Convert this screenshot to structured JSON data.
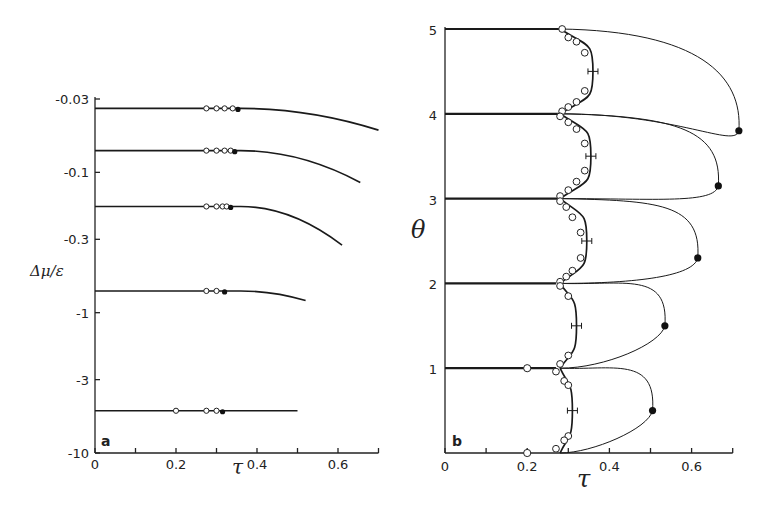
{
  "chart_data": [
    {
      "panel": "a",
      "type": "line",
      "title": "",
      "xlabel": "τ",
      "ylabel": "Δμ/ε",
      "xlim": [
        0,
        0.7
      ],
      "x_ticks": [
        0,
        0.1,
        0.2,
        0.3,
        0.4,
        0.5,
        0.6,
        0.7
      ],
      "x_tick_labels": [
        "0",
        "",
        "0.2",
        "",
        "0.4",
        "",
        "0.6",
        ""
      ],
      "y_scale": "log (negative)",
      "y_ticks": [
        -0.03,
        -0.1,
        -0.3,
        -1,
        -3,
        -10
      ],
      "y_tick_labels": [
        "-0.03",
        "-0.1",
        "-0.3",
        "-1",
        "-3",
        "-10"
      ],
      "grid": false,
      "series": [
        {
          "name": "line-1",
          "y0": -0.035,
          "x_end": 0.7,
          "y_end": -0.05,
          "open_markers": [
            0.275,
            0.3,
            0.32,
            0.34
          ],
          "filled_markers": [
            0.353
          ]
        },
        {
          "name": "line-2",
          "y0": -0.07,
          "x_end": 0.655,
          "y_end": -0.118,
          "open_markers": [
            0.275,
            0.3,
            0.32,
            0.335
          ],
          "filled_markers": [
            0.345
          ]
        },
        {
          "name": "line-3",
          "y0": -0.175,
          "x_end": 0.61,
          "y_end": -0.33,
          "open_markers": [
            0.275,
            0.3,
            0.315,
            0.325
          ],
          "filled_markers": [
            0.335
          ]
        },
        {
          "name": "line-4",
          "y0": -0.7,
          "x_end": 0.52,
          "y_end": -0.82,
          "open_markers": [
            0.275,
            0.3
          ],
          "filled_markers": [
            0.32
          ]
        },
        {
          "name": "line-5",
          "y0": -5.0,
          "x_end": 0.5,
          "y_end": -5.0,
          "open_markers": [
            0.2,
            0.275,
            0.3
          ],
          "filled_markers": [
            0.315
          ]
        }
      ]
    },
    {
      "panel": "b",
      "type": "line",
      "title": "",
      "xlabel": "τ",
      "ylabel": "θ",
      "xlim": [
        0,
        0.7
      ],
      "ylim": [
        0,
        5
      ],
      "x_ticks": [
        0,
        0.1,
        0.2,
        0.3,
        0.4,
        0.5,
        0.6,
        0.7
      ],
      "x_tick_labels": [
        "0",
        "",
        "0.2",
        "",
        "0.4",
        "",
        "0.6",
        ""
      ],
      "y_ticks": [
        1,
        2,
        3,
        4,
        5
      ],
      "y_tick_labels": [
        "1",
        "2",
        "3",
        "4",
        "5"
      ],
      "grid": false,
      "horizontal_lines": [
        {
          "theta": 5,
          "x_end": 0.285
        },
        {
          "theta": 4,
          "x_end": 0.28
        },
        {
          "theta": 3,
          "x_end": 0.275
        },
        {
          "theta": 2,
          "x_end": 0.27
        },
        {
          "theta": 1,
          "x_end": 0.27
        }
      ],
      "inner_loops": [
        {
          "from": 4,
          "to": 5,
          "max_tau": 0.36,
          "open_markers": [
            [
              0.285,
              5.0
            ],
            [
              0.3,
              4.9
            ],
            [
              0.32,
              4.85
            ],
            [
              0.34,
              4.72
            ],
            [
              0.34,
              4.27
            ],
            [
              0.32,
              4.14
            ],
            [
              0.3,
              4.08
            ],
            [
              0.285,
              4.03
            ]
          ],
          "error_bar": [
            0.36,
            4.5
          ]
        },
        {
          "from": 3,
          "to": 4,
          "max_tau": 0.355,
          "open_markers": [
            [
              0.28,
              3.97
            ],
            [
              0.3,
              3.9
            ],
            [
              0.32,
              3.82
            ],
            [
              0.34,
              3.65
            ],
            [
              0.34,
              3.33
            ],
            [
              0.32,
              3.2
            ],
            [
              0.3,
              3.1
            ],
            [
              0.28,
              3.03
            ]
          ],
          "error_bar": [
            0.355,
            3.5
          ]
        },
        {
          "from": 2,
          "to": 3,
          "max_tau": 0.345,
          "open_markers": [
            [
              0.28,
              2.97
            ],
            [
              0.295,
              2.9
            ],
            [
              0.31,
              2.78
            ],
            [
              0.33,
              2.6
            ],
            [
              0.33,
              2.3
            ],
            [
              0.31,
              2.15
            ],
            [
              0.295,
              2.08
            ],
            [
              0.28,
              2.02
            ]
          ],
          "error_bar": [
            0.345,
            2.5
          ]
        },
        {
          "from": 1,
          "to": 2,
          "max_tau": 0.32,
          "open_markers": [
            [
              0.28,
              1.97
            ],
            [
              0.3,
              1.85
            ],
            [
              0.3,
              1.15
            ],
            [
              0.28,
              1.05
            ]
          ],
          "error_bar": [
            0.32,
            1.5
          ]
        },
        {
          "from": 0,
          "to": 1,
          "max_tau": 0.31,
          "open_markers": [
            [
              0.27,
              0.96
            ],
            [
              0.29,
              0.85
            ],
            [
              0.3,
              0.8
            ],
            [
              0.3,
              0.2
            ],
            [
              0.29,
              0.15
            ],
            [
              0.27,
              0.05
            ]
          ],
          "error_bar": [
            0.31,
            0.5
          ]
        }
      ],
      "outer_loops": [
        {
          "from": 4,
          "to": 5,
          "nose": [
            0.715,
            3.8
          ]
        },
        {
          "from": 3,
          "to": 4,
          "nose": [
            0.665,
            3.15
          ]
        },
        {
          "from": 2,
          "to": 3,
          "nose": [
            0.615,
            2.3
          ]
        },
        {
          "from": 1,
          "to": 2,
          "nose": [
            0.535,
            1.5
          ]
        },
        {
          "from": 0,
          "to": 1,
          "nose": [
            0.505,
            0.5
          ]
        }
      ],
      "extra_open_markers": [
        [
          0.2,
          1.0
        ],
        [
          0.2,
          0.0
        ]
      ]
    }
  ],
  "labels": {
    "panel_a": "a",
    "panel_b": "b"
  }
}
